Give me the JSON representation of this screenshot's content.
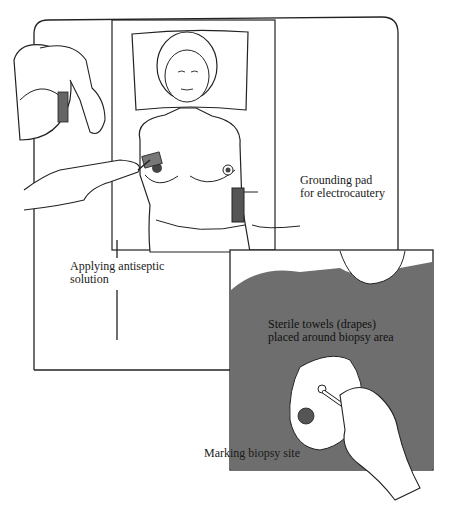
{
  "figure": {
    "panels": [
      {
        "id": "main-panel",
        "description": "Patient supine on table with pillow; clinician applying antiseptic solution to breast; grounding pad on flank"
      },
      {
        "id": "inset-panel",
        "description": "Close-up of sterile drapes around breast; hand marking biopsy site with pen"
      }
    ],
    "labels": {
      "grounding_line1": "Grounding pad",
      "grounding_line2": "for electrocautery",
      "antiseptic_line1": "Applying antiseptic",
      "antiseptic_line2": "solution",
      "towels_line1": "Sterile towels (drapes)",
      "towels_line2": "placed around biopsy area",
      "marking": "Marking biopsy site"
    },
    "colors": {
      "line": "#222222",
      "drape": "#6e6e6e",
      "skin": "#ffffff",
      "pad": "#555555"
    }
  }
}
